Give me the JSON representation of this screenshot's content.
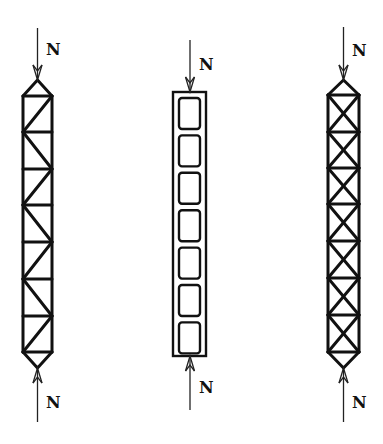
{
  "figure": {
    "force_label": "N",
    "stroke_color": "#111111",
    "background": "#ffffff"
  },
  "columns": [
    {
      "id": "single-diagonal-truss",
      "type": "truss",
      "bracing": "single-diagonal-alternating",
      "axis_x": 37.5,
      "left_x": 23,
      "right_x": 52,
      "apex_top_y": 80,
      "apex_bottom_y": 368,
      "panel_ys": [
        96,
        132,
        169,
        205,
        242,
        279,
        316,
        352
      ],
      "panel_count": 7,
      "top_arrow": {
        "from_y": 28,
        "to_y": 80,
        "label": "N",
        "label_x": 46,
        "label_y": 55
      },
      "bottom_arrow": {
        "from_y": 422,
        "to_y": 368,
        "label": "N",
        "label_x": 46,
        "label_y": 408
      }
    },
    {
      "id": "battened-column",
      "type": "battened",
      "axis_x": 190,
      "outer_left": 173,
      "outer_right": 206,
      "outer_top": 92,
      "outer_bottom": 356,
      "inner_left": 179,
      "inner_right": 200,
      "inner_box_count": 7,
      "inner_box_height": 31,
      "inner_gap": 6.4,
      "top_arrow": {
        "from_y": 40,
        "to_y": 92,
        "label": "N",
        "label_x": 199,
        "label_y": 70
      },
      "bottom_arrow": {
        "from_y": 410,
        "to_y": 356,
        "label": "N",
        "label_x": 199,
        "label_y": 393
      }
    },
    {
      "id": "cross-braced-truss",
      "type": "truss",
      "bracing": "x-bracing",
      "axis_x": 343.5,
      "left_x": 328,
      "right_x": 359,
      "apex_top_y": 80,
      "apex_bottom_y": 368,
      "panel_ys": [
        95,
        132,
        168,
        204,
        241,
        278,
        315,
        352
      ],
      "panel_count": 7,
      "top_arrow": {
        "from_y": 27,
        "to_y": 80,
        "label": "N",
        "label_x": 352,
        "label_y": 56
      },
      "bottom_arrow": {
        "from_y": 422,
        "to_y": 368,
        "label": "N",
        "label_x": 352,
        "label_y": 408
      }
    }
  ]
}
